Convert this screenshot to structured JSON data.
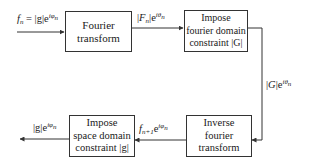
{
  "diagram": {
    "type": "flowchart",
    "title": "",
    "nodes": [
      {
        "id": "fourier-transform",
        "lines": [
          "Fourier",
          "transform"
        ]
      },
      {
        "id": "impose-fourier-constraint",
        "lines": [
          "Impose",
          "fourier domain",
          "constraint |G|"
        ]
      },
      {
        "id": "inverse-fourier-transform",
        "lines": [
          "Inverse",
          "fourier",
          "transform"
        ]
      },
      {
        "id": "impose-space-constraint",
        "lines": [
          "Impose",
          "space domain",
          "constraint |g|"
        ]
      }
    ],
    "edges": [
      {
        "from": "input",
        "to": "fourier-transform",
        "label": "f_n = |g|e^{iφ_n}"
      },
      {
        "from": "fourier-transform",
        "to": "impose-fourier-constraint",
        "label": "|F_n|e^{iθ_n}"
      },
      {
        "from": "impose-fourier-constraint",
        "to": "inverse-fourier-transform",
        "label": "|G|e^{iθ_n}"
      },
      {
        "from": "inverse-fourier-transform",
        "to": "impose-space-constraint",
        "label": "f_{n+1}e^{iφ_n}"
      },
      {
        "from": "impose-space-constraint",
        "to": "output",
        "label": "|g|e^{iφ_n}"
      }
    ],
    "colors": {
      "line": "#333333",
      "text": "#1a1a1a",
      "background": "#ffffff"
    }
  },
  "labels": {
    "input": {
      "f": "f",
      "n": "n",
      "eq": " = |g|e",
      "exp": "iφ",
      "expsub": "n"
    },
    "fourier_out": {
      "pre": "|",
      "F": "F",
      "n": "n",
      "post": "|e",
      "exp": "iθ",
      "expsub": "n"
    },
    "constraint_out": {
      "pre": "|",
      "G": "G",
      "post": "|e",
      "exp": "iθ",
      "expsub": "n"
    },
    "inverse_out": {
      "f": "f",
      "n": "n+1",
      "post": "e",
      "exp": "iφ",
      "expsub": "n"
    },
    "output": {
      "pre": "|g|e",
      "exp": "iφ",
      "expsub": "n"
    }
  },
  "boxes": {
    "b1": {
      "l1": "Fourier",
      "l2": "transform"
    },
    "b2": {
      "l1": "Impose",
      "l2": "fourier domain",
      "l3": "constraint |G|"
    },
    "b3": {
      "l1": "Inverse",
      "l2": "fourier",
      "l3": "transform"
    },
    "b4": {
      "l1": "Impose",
      "l2": "space domain",
      "l3": "constraint |g|"
    }
  }
}
